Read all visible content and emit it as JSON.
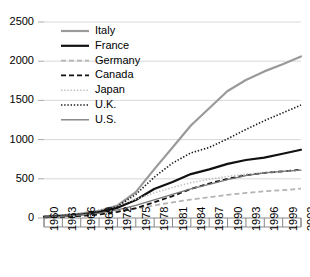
{
  "chart_data": {
    "type": "line",
    "title": "",
    "subtitle": "",
    "xlabel": "",
    "ylabel": "",
    "xlim": [
      1960,
      2002
    ],
    "ylim": [
      0,
      2500
    ],
    "grid": true,
    "legend_position": "top-left-inside",
    "yticks": [
      0,
      500,
      1000,
      1500,
      2000,
      2500
    ],
    "ytick_labels": [
      "0",
      "500",
      "1000",
      "1500",
      "2000",
      "2500"
    ],
    "xticks": [
      1960,
      1963,
      1966,
      1969,
      1972,
      1975,
      1978,
      1981,
      1984,
      1987,
      1990,
      1993,
      1996,
      1999,
      2002
    ],
    "xtick_labels": [
      "1960",
      "1963",
      "1966",
      "1969",
      "1972",
      "1975",
      "1978",
      "1981",
      "1984",
      "1987",
      "1990",
      "1993",
      "1996",
      "1999",
      "2002"
    ],
    "x": [
      1960,
      1963,
      1966,
      1969,
      1972,
      1975,
      1978,
      1981,
      1984,
      1987,
      1990,
      1993,
      1996,
      1999,
      2002
    ],
    "series": [
      {
        "name": "Italy",
        "color": "#9a9a9a",
        "style": "solid",
        "width": 2.2,
        "values": [
          20,
          35,
          55,
          90,
          160,
          330,
          620,
          900,
          1180,
          1400,
          1620,
          1760,
          1870,
          1960,
          2060
        ]
      },
      {
        "name": "France",
        "color": "#111111",
        "style": "solid",
        "width": 2.2,
        "values": [
          15,
          28,
          45,
          75,
          130,
          230,
          370,
          460,
          560,
          620,
          690,
          740,
          770,
          820,
          870
        ]
      },
      {
        "name": "Germany",
        "color": "#b4b4b4",
        "style": "dashed",
        "width": 1.8,
        "values": [
          10,
          18,
          30,
          48,
          80,
          120,
          160,
          200,
          235,
          265,
          295,
          320,
          340,
          355,
          375
        ]
      },
      {
        "name": "Canada",
        "color": "#111111",
        "style": "dashed",
        "width": 1.8,
        "values": [
          8,
          15,
          26,
          45,
          78,
          125,
          200,
          280,
          370,
          440,
          500,
          545,
          575,
          595,
          615
        ]
      },
      {
        "name": "Japan",
        "color": "#c0c0c0",
        "style": "dotted",
        "width": 1.6,
        "values": [
          18,
          33,
          58,
          100,
          165,
          240,
          320,
          390,
          450,
          495,
          530,
          560,
          580,
          595,
          610
        ]
      },
      {
        "name": "U.K.",
        "color": "#1a1a1a",
        "style": "dotted",
        "width": 1.6,
        "values": [
          14,
          27,
          48,
          85,
          150,
          300,
          520,
          700,
          830,
          900,
          1010,
          1130,
          1240,
          1340,
          1440
        ]
      },
      {
        "name": "U.S.",
        "color": "#777777",
        "style": "solid",
        "width": 1.3,
        "values": [
          12,
          22,
          38,
          62,
          105,
          160,
          230,
          300,
          370,
          430,
          490,
          540,
          575,
          595,
          610
        ]
      }
    ]
  },
  "legend": {
    "items": [
      {
        "label": "Italy"
      },
      {
        "label": "France"
      },
      {
        "label": "Germany"
      },
      {
        "label": "Canada"
      },
      {
        "label": "Japan"
      },
      {
        "label": "U.K."
      },
      {
        "label": "U.S."
      }
    ]
  }
}
